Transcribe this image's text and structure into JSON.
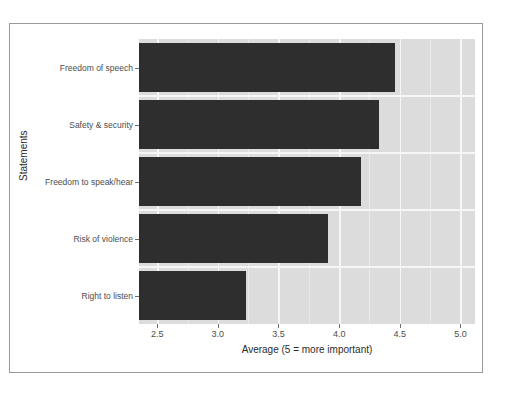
{
  "chart_data": {
    "type": "bar",
    "orientation": "horizontal",
    "title": "",
    "xlabel": "Average (5 = more important)",
    "ylabel": "Statements",
    "categories": [
      "Freedom of speech",
      "Safety & security",
      "Freedom to speak/hear",
      "Risk of violence",
      "Right to listen"
    ],
    "values": [
      4.46,
      4.33,
      4.18,
      3.91,
      3.23
    ],
    "xlim": [
      2.35,
      5.12
    ],
    "xticks": [
      2.5,
      3.0,
      3.5,
      4.0,
      4.5,
      5.0
    ],
    "xtick_labels": [
      "2.5",
      "3.0",
      "3.5",
      "4.0",
      "4.5",
      "5.0"
    ],
    "xticks_minor": [
      2.75,
      3.25,
      3.75,
      4.25,
      4.75
    ],
    "grid": true,
    "legend": false,
    "bar_color": "#2e2e2e",
    "panel_color": "#dcdcdc",
    "grid_color": "#f6f6f6",
    "frame_color": "#9a9a9a"
  }
}
